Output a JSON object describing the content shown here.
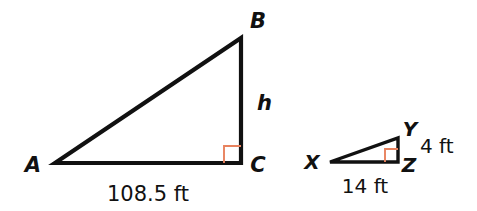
{
  "figure": {
    "background_color": "#ffffff",
    "stroke_color": "#111111",
    "right_angle_color": "#E8825E"
  },
  "large_triangle": {
    "name": "triangle-ABC",
    "vertices": {
      "A": {
        "label": "A",
        "x": 55,
        "y": 163,
        "label_x": 33,
        "label_y": 172
      },
      "B": {
        "label": "B",
        "x": 241,
        "y": 38,
        "label_x": 253,
        "label_y": 28
      },
      "C": {
        "label": "C",
        "x": 241,
        "y": 163,
        "label_x": 253,
        "label_y": 172
      }
    },
    "right_angle_at": "C",
    "right_angle_marker": {
      "size": 17
    },
    "side_labels": {
      "base": "108.5 ft",
      "base_x": 148,
      "base_y": 199,
      "height": "h",
      "height_x": 256,
      "height_y": 110
    }
  },
  "small_triangle": {
    "name": "triangle-XYZ",
    "vertices": {
      "X": {
        "label": "X",
        "x": 330,
        "y": 162,
        "label_x": 312,
        "label_y": 169
      },
      "Y": {
        "label": "Y",
        "x": 398,
        "y": 138,
        "label_x": 405,
        "label_y": 133
      },
      "Z": {
        "label": "Z",
        "x": 398,
        "y": 162,
        "label_x": 409,
        "label_y": 171
      }
    },
    "right_angle_at": "Z",
    "right_angle_marker": {
      "size": 13
    },
    "side_labels": {
      "base": "14 ft",
      "base_x": 365,
      "base_y": 192,
      "height": "4 ft",
      "height_x": 421,
      "height_y": 152
    }
  }
}
